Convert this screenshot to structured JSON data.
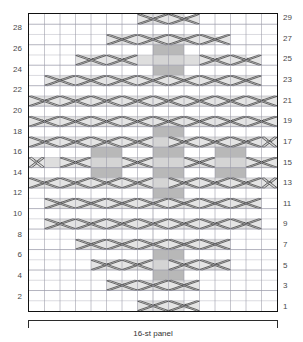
{
  "chart_title": "16-st panel cable chart",
  "panel": {
    "caption": "16-st panel",
    "stitch_count": 16,
    "row_count": 29
  },
  "grid": {
    "columns": 16,
    "rows": 29,
    "cell_width": 15.625,
    "cell_height": 10.3,
    "grid_line_color": "#9a9aa8",
    "border_color": "#111111",
    "shade_fill": "#b8b8b8",
    "cable_fill": "#d8d8d8",
    "cable_stroke": "#333333"
  },
  "row_labels": {
    "left": [
      "28",
      "26",
      "24",
      "22",
      "20",
      "18",
      "16",
      "14",
      "12",
      "10",
      "8",
      "6",
      "4",
      "2"
    ],
    "right": [
      "29",
      "27",
      "25",
      "23",
      "21",
      "19",
      "17",
      "15",
      "13",
      "11",
      "9",
      "7",
      "5",
      "3",
      "1"
    ]
  },
  "chart_data": {
    "type": "heatmap",
    "title": "16-st panel",
    "xlabel": "stitches",
    "ylabel": "rows",
    "columns": 16,
    "rows": 29,
    "legend": [
      {
        "symbol": "blank",
        "label": "purl / background"
      },
      {
        "symbol": "shaded",
        "label": "knit (shaded cell)"
      },
      {
        "symbol": "cable-right",
        "label": "right cross cable (2 st)"
      },
      {
        "symbol": "cable-left",
        "label": "left cross cable (2 st)"
      }
    ],
    "shaded_cells": [
      {
        "row": 27,
        "cols": [
          8,
          9
        ]
      },
      {
        "row": 26,
        "cols": [
          8,
          9
        ]
      },
      {
        "row": 25,
        "cols": [
          8,
          9
        ]
      },
      {
        "row": 24,
        "cols": [
          8,
          9
        ]
      },
      {
        "row": 19,
        "cols": [
          8,
          9
        ]
      },
      {
        "row": 18,
        "cols": [
          8,
          9
        ]
      },
      {
        "row": 17,
        "cols": [
          8,
          9
        ]
      },
      {
        "row": 16,
        "cols": [
          4,
          5,
          8,
          9,
          12,
          13
        ]
      },
      {
        "row": 15,
        "cols": [
          4,
          5,
          8,
          9,
          12,
          13
        ]
      },
      {
        "row": 14,
        "cols": [
          4,
          5,
          8,
          9,
          12,
          13
        ]
      },
      {
        "row": 13,
        "cols": [
          8,
          9
        ]
      },
      {
        "row": 12,
        "cols": [
          8,
          9
        ]
      },
      {
        "row": 11,
        "cols": [
          8,
          9
        ]
      },
      {
        "row": 6,
        "cols": [
          8,
          9
        ]
      },
      {
        "row": 5,
        "cols": [
          8,
          9
        ]
      },
      {
        "row": 4,
        "cols": [
          8,
          9
        ]
      },
      {
        "row": 3,
        "cols": [
          8,
          9
        ]
      }
    ],
    "cables": [
      {
        "row": 29,
        "col": 7,
        "dir": "right"
      },
      {
        "row": 29,
        "col": 9,
        "dir": "left"
      },
      {
        "row": 27,
        "col": 5,
        "dir": "right"
      },
      {
        "row": 27,
        "col": 7,
        "dir": "right"
      },
      {
        "row": 27,
        "col": 9,
        "dir": "left"
      },
      {
        "row": 27,
        "col": 11,
        "dir": "left"
      },
      {
        "row": 25,
        "col": 3,
        "dir": "right"
      },
      {
        "row": 25,
        "col": 5,
        "dir": "right"
      },
      {
        "row": 25,
        "col": 11,
        "dir": "left"
      },
      {
        "row": 25,
        "col": 13,
        "dir": "left"
      },
      {
        "row": 23,
        "col": 1,
        "dir": "right"
      },
      {
        "row": 23,
        "col": 3,
        "dir": "right"
      },
      {
        "row": 23,
        "col": 5,
        "dir": "right"
      },
      {
        "row": 23,
        "col": 7,
        "dir": "right"
      },
      {
        "row": 23,
        "col": 9,
        "dir": "left"
      },
      {
        "row": 23,
        "col": 11,
        "dir": "left"
      },
      {
        "row": 23,
        "col": 13,
        "dir": "left"
      },
      {
        "row": 21,
        "col": 0,
        "dir": "right"
      },
      {
        "row": 21,
        "col": 2,
        "dir": "right"
      },
      {
        "row": 21,
        "col": 4,
        "dir": "right"
      },
      {
        "row": 21,
        "col": 6,
        "dir": "right"
      },
      {
        "row": 21,
        "col": 8,
        "dir": "left"
      },
      {
        "row": 21,
        "col": 10,
        "dir": "left"
      },
      {
        "row": 21,
        "col": 12,
        "dir": "left"
      },
      {
        "row": 21,
        "col": 14,
        "dir": "left"
      },
      {
        "row": 19,
        "col": 0,
        "dir": "right"
      },
      {
        "row": 19,
        "col": 2,
        "dir": "right"
      },
      {
        "row": 19,
        "col": 4,
        "dir": "right"
      },
      {
        "row": 19,
        "col": 6,
        "dir": "right"
      },
      {
        "row": 19,
        "col": 8,
        "dir": "left"
      },
      {
        "row": 19,
        "col": 10,
        "dir": "left"
      },
      {
        "row": 19,
        "col": 12,
        "dir": "left"
      },
      {
        "row": 19,
        "col": 14,
        "dir": "left"
      },
      {
        "row": 17,
        "col": 0,
        "dir": "right"
      },
      {
        "row": 17,
        "col": 2,
        "dir": "right"
      },
      {
        "row": 17,
        "col": 4,
        "dir": "right"
      },
      {
        "row": 17,
        "col": 6,
        "dir": "right"
      },
      {
        "row": 17,
        "col": 9,
        "dir": "left"
      },
      {
        "row": 17,
        "col": 11,
        "dir": "left"
      },
      {
        "row": 17,
        "col": 13,
        "dir": "left"
      },
      {
        "row": 17,
        "col": 15,
        "dir": "left"
      },
      {
        "row": 15,
        "col": -1,
        "dir": "right"
      },
      {
        "row": 15,
        "col": 2,
        "dir": "right"
      },
      {
        "row": 15,
        "col": 6,
        "dir": "right"
      },
      {
        "row": 15,
        "col": 10,
        "dir": "left"
      },
      {
        "row": 15,
        "col": 14,
        "dir": "left"
      },
      {
        "row": 13,
        "col": 0,
        "dir": "right"
      },
      {
        "row": 13,
        "col": 2,
        "dir": "right"
      },
      {
        "row": 13,
        "col": 4,
        "dir": "right"
      },
      {
        "row": 13,
        "col": 6,
        "dir": "right"
      },
      {
        "row": 13,
        "col": 9,
        "dir": "left"
      },
      {
        "row": 13,
        "col": 11,
        "dir": "left"
      },
      {
        "row": 13,
        "col": 13,
        "dir": "left"
      },
      {
        "row": 13,
        "col": 15,
        "dir": "left"
      },
      {
        "row": 11,
        "col": 1,
        "dir": "right"
      },
      {
        "row": 11,
        "col": 3,
        "dir": "right"
      },
      {
        "row": 11,
        "col": 5,
        "dir": "right"
      },
      {
        "row": 11,
        "col": 7,
        "dir": "right"
      },
      {
        "row": 11,
        "col": 9,
        "dir": "left"
      },
      {
        "row": 11,
        "col": 11,
        "dir": "left"
      },
      {
        "row": 11,
        "col": 13,
        "dir": "left"
      },
      {
        "row": 9,
        "col": 1,
        "dir": "right"
      },
      {
        "row": 9,
        "col": 3,
        "dir": "right"
      },
      {
        "row": 9,
        "col": 5,
        "dir": "right"
      },
      {
        "row": 9,
        "col": 7,
        "dir": "right"
      },
      {
        "row": 9,
        "col": 9,
        "dir": "left"
      },
      {
        "row": 9,
        "col": 11,
        "dir": "left"
      },
      {
        "row": 9,
        "col": 13,
        "dir": "left"
      },
      {
        "row": 7,
        "col": 3,
        "dir": "right"
      },
      {
        "row": 7,
        "col": 5,
        "dir": "right"
      },
      {
        "row": 7,
        "col": 7,
        "dir": "right"
      },
      {
        "row": 7,
        "col": 9,
        "dir": "left"
      },
      {
        "row": 7,
        "col": 11,
        "dir": "left"
      },
      {
        "row": 5,
        "col": 4,
        "dir": "right"
      },
      {
        "row": 5,
        "col": 6,
        "dir": "right"
      },
      {
        "row": 5,
        "col": 9,
        "dir": "left"
      },
      {
        "row": 5,
        "col": 11,
        "dir": "left"
      },
      {
        "row": 3,
        "col": 5,
        "dir": "right"
      },
      {
        "row": 3,
        "col": 7,
        "dir": "right"
      },
      {
        "row": 3,
        "col": 9,
        "dir": "left"
      },
      {
        "row": 1,
        "col": 7,
        "dir": "right"
      },
      {
        "row": 1,
        "col": 9,
        "dir": "left"
      }
    ],
    "cable_bands": [
      {
        "row": 29,
        "col_start": 7,
        "col_end": 10
      },
      {
        "row": 27,
        "col_start": 5,
        "col_end": 12
      },
      {
        "row": 25,
        "col_start": 3,
        "col_end": 14
      },
      {
        "row": 23,
        "col_start": 1,
        "col_end": 15
      },
      {
        "row": 21,
        "col_start": 0,
        "col_end": 16
      },
      {
        "row": 19,
        "col_start": 0,
        "col_end": 16
      },
      {
        "row": 17,
        "col_start": 0,
        "col_end": 16
      },
      {
        "row": 15,
        "col_start": 0,
        "col_end": 16
      },
      {
        "row": 13,
        "col_start": 0,
        "col_end": 16
      },
      {
        "row": 11,
        "col_start": 1,
        "col_end": 15
      },
      {
        "row": 9,
        "col_start": 1,
        "col_end": 15
      },
      {
        "row": 7,
        "col_start": 3,
        "col_end": 13
      },
      {
        "row": 5,
        "col_start": 4,
        "col_end": 13
      },
      {
        "row": 3,
        "col_start": 5,
        "col_end": 11
      },
      {
        "row": 1,
        "col_start": 7,
        "col_end": 10
      }
    ]
  }
}
